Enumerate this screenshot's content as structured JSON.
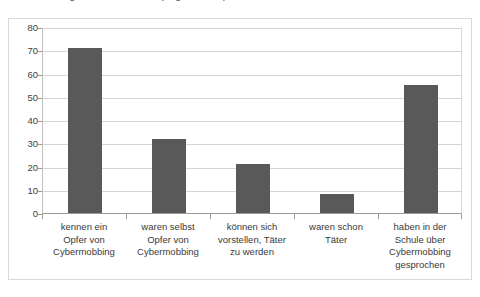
{
  "chart_data": {
    "type": "bar",
    "title": "Kinder oder Jugendliche im Internet (Angaben in %)",
    "xlabel": "",
    "ylabel": "",
    "ylim": [
      0,
      80
    ],
    "ytick_step": 10,
    "yticks": [
      "80",
      "70",
      "60",
      "50",
      "40",
      "30",
      "20",
      "10",
      "0"
    ],
    "grid": true,
    "legend": false,
    "legend_position": "none",
    "bar_color": "#595959",
    "gridline_color": "#d4d4d4",
    "axis_color": "#9a9a9a",
    "frame_color": "#d9d9d9",
    "categories": [
      "kennen ein\nOpfer von\nCybermobbing",
      "waren selbst\nOpfer von\nCybermobbing",
      "können sich\nvorstellen, Täter\nzu werden",
      "waren schon\nTäter",
      "haben in der\nSchule über\nCybermobbing\ngesprochen"
    ],
    "values": [
      71,
      32,
      21,
      8,
      55
    ]
  }
}
